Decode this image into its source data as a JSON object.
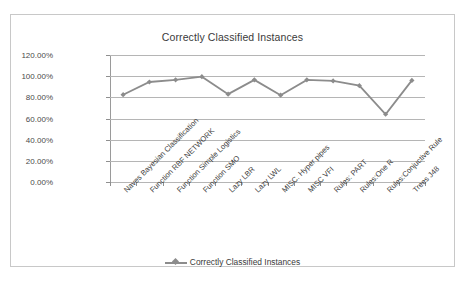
{
  "chart_data": {
    "type": "line",
    "title": "Correctly Classified Instances",
    "xlabel": "",
    "ylabel": "",
    "ylim": [
      0,
      120
    ],
    "ytick_labels": [
      "120.00%",
      "100.00%",
      "80.00%",
      "60.00%",
      "40.00%",
      "20.00%",
      "0.00%"
    ],
    "ytick_values": [
      120,
      100,
      80,
      60,
      40,
      20,
      0
    ],
    "grid": true,
    "legend_position": "bottom",
    "categories": [
      "Naves Bayesian Classification",
      "Function RBF NETWORK",
      "Function Simple Logistics",
      "Function SMO",
      "Lazy LBR",
      "Lazy LWL",
      "MISC. Hyper pipes",
      "MISC VFI",
      "Rules: PART",
      "Rules:One R",
      "Rules:Conjuctive Rule",
      "Trees J48"
    ],
    "series": [
      {
        "name": "Correctly Classified Instances",
        "values": [
          82.5,
          94.5,
          96.5,
          99.5,
          83.0,
          96.5,
          82.0,
          96.5,
          95.5,
          91.0,
          64.0,
          96.0
        ],
        "color": "#8c8c8c",
        "marker": "diamond"
      }
    ]
  },
  "legend": {
    "entries": [
      {
        "label": "Correctly Classified Instances"
      }
    ]
  },
  "colors": {
    "series": "#8c8c8c",
    "gridline": "#b5b5b5",
    "axis": "#9a9a9a",
    "frame": "#c8c8c8",
    "text": "#3a3a3a"
  }
}
